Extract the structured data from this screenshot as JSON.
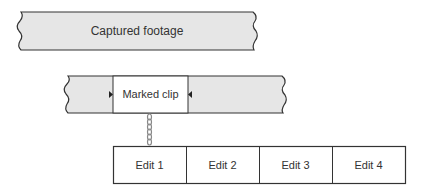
{
  "diagram": {
    "captured_footage": {
      "label": "Captured footage",
      "fill": "#e6e6e6"
    },
    "marked_clip": {
      "label": "Marked clip",
      "fill": "#ffffff",
      "band_fill": "#e6e6e6"
    },
    "edits": [
      {
        "label": "Edit 1"
      },
      {
        "label": "Edit 2"
      },
      {
        "label": "Edit 3"
      },
      {
        "label": "Edit 4"
      }
    ],
    "colors": {
      "stroke": "#333333",
      "band": "#e6e6e6",
      "chain": "#888888"
    }
  }
}
